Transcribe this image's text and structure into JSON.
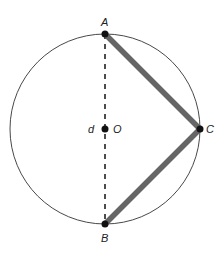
{
  "diagram": {
    "type": "geometry-circle-inscribed-angle",
    "circle": {
      "center_label": "O",
      "cx": 105,
      "cy": 129,
      "r": 95
    },
    "points": [
      {
        "id": "A",
        "label": "A",
        "x": 105,
        "y": 34
      },
      {
        "id": "B",
        "label": "B",
        "x": 105,
        "y": 224
      },
      {
        "id": "C",
        "label": "C",
        "x": 200,
        "y": 129
      },
      {
        "id": "O",
        "label": "O",
        "x": 105,
        "y": 129
      }
    ],
    "diameter_label": "d",
    "segments": [
      {
        "from": "A",
        "to": "B",
        "style": "dashed",
        "meaning": "diameter d"
      },
      {
        "from": "A",
        "to": "C",
        "style": "thick"
      },
      {
        "from": "C",
        "to": "B",
        "style": "thick"
      }
    ],
    "colors": {
      "circle": "#333333",
      "thick_segment": "#666666",
      "point": "#111111"
    }
  }
}
